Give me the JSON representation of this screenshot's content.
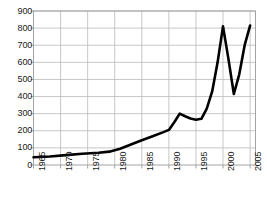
{
  "chart_data": {
    "type": "line",
    "title": "",
    "subtitle": "",
    "xlabel": "",
    "ylabel": "",
    "xlim": [
      1965,
      2006
    ],
    "ylim": [
      0,
      900
    ],
    "grid": true,
    "legend": false,
    "legend_position": "none",
    "line_color": "#000000",
    "grid_color": "#b9b9b9",
    "frame_color": "#9a9a9a",
    "background": "#ffffff",
    "y_ticks": [
      0,
      100,
      200,
      300,
      400,
      500,
      600,
      700,
      800,
      900
    ],
    "y_tick_labels": [
      "0",
      "100",
      "200",
      "300",
      "400",
      "500",
      "600",
      "700",
      "800",
      "900"
    ],
    "x_ticks": [
      1965,
      1970,
      1975,
      1980,
      1985,
      1990,
      1995,
      2000,
      2005
    ],
    "x_tick_labels": [
      "1965",
      "1970",
      "1975",
      "1980",
      "1985",
      "1990",
      "1995",
      "2000",
      "2005"
    ],
    "x_tick_label_rotation": 90,
    "series": [
      {
        "name": "series-1",
        "color": "#000000",
        "line_width": 2.6,
        "markers": false,
        "x": [
          1965,
          1968,
          1971,
          1974,
          1977,
          1979,
          1981,
          1983,
          1985,
          1987,
          1989,
          1990,
          1991,
          1992,
          1993,
          1994,
          1995,
          1996,
          1997,
          1998,
          1999,
          2000,
          2001,
          2002,
          2003,
          2004,
          2005
        ],
        "y": [
          45,
          50,
          58,
          66,
          72,
          78,
          95,
          120,
          145,
          168,
          192,
          205,
          250,
          300,
          285,
          272,
          265,
          270,
          330,
          430,
          600,
          810,
          620,
          415,
          530,
          700,
          815
        ]
      }
    ],
    "annotations": []
  },
  "axes": {
    "y_axis_name": "y-axis",
    "x_axis_name": "x-axis"
  },
  "caption": {
    "text": ""
  }
}
